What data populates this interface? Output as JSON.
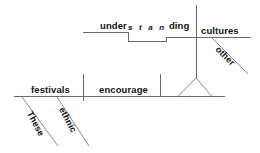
{
  "diagram": {
    "type": "reed-kellogg-sentence-diagram",
    "sentence": "These ethnic festivals encourage understanding of other cultures",
    "colors": {
      "background": "#ffffff",
      "line": "#6b6b6b",
      "diagonal_line": "#8a8a8a",
      "text": "#131313"
    },
    "words": {
      "subject": "festivals",
      "verb": "encourage",
      "object_word_part_a": "under",
      "object_word_part_b": "s t a n",
      "object_word_part_c": "ding",
      "object_word_full": "understanding",
      "upper_object": "cultures",
      "modifier_determiner": "These",
      "modifier_adjective": "ethnic",
      "modifier_other": "other"
    }
  }
}
